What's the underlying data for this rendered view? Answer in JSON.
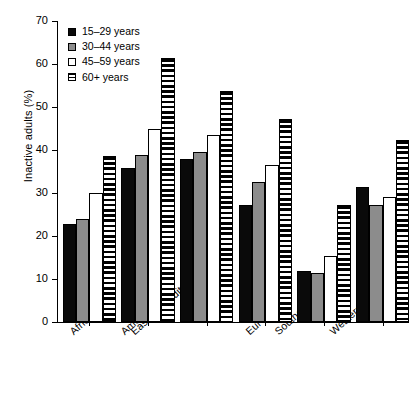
{
  "chart_data": {
    "type": "bar",
    "title": "",
    "xlabel": "",
    "ylabel": "Inactive adults (%)",
    "ylim": [
      0,
      70
    ],
    "yticks": [
      0,
      10,
      20,
      30,
      40,
      50,
      60,
      70
    ],
    "grid": false,
    "legend_position": "top-left",
    "categories": [
      "Africa",
      "Americas",
      "Eastern Mediterranean",
      "Europe",
      "Southeast Asia",
      "Western Pacific"
    ],
    "series": [
      {
        "name": "15–29 years",
        "color": "#0a0a0a",
        "pattern": "solid-black",
        "values": [
          22.8,
          35.9,
          37.8,
          27.3,
          11.9,
          31.3
        ]
      },
      {
        "name": "30–44 years",
        "color": "#8c8c8c",
        "pattern": "solid-gray",
        "values": [
          23.9,
          38.9,
          39.6,
          32.5,
          11.4,
          27.2
        ]
      },
      {
        "name": "45–59 years",
        "color": "#ffffff",
        "pattern": "solid-white",
        "values": [
          30.0,
          44.8,
          43.5,
          36.5,
          15.4,
          29.0
        ]
      },
      {
        "name": "60+ years",
        "color": "#000000",
        "pattern": "horizontal-stripes",
        "values": [
          38.7,
          61.5,
          53.7,
          47.3,
          27.2,
          42.3
        ]
      }
    ]
  },
  "legend": {
    "items": [
      {
        "label": "15–29 years"
      },
      {
        "label": "30–44 years"
      },
      {
        "label": "45–59 years"
      },
      {
        "label": "60+ years"
      }
    ]
  },
  "axes": {
    "y_title": "Inactive adults (%)",
    "y_tick_labels": [
      "0",
      "10",
      "20",
      "30",
      "40",
      "50",
      "60",
      "70"
    ],
    "x_tick_labels": [
      "Africa",
      "Americas",
      "Eastern Mediterranean",
      "Europe",
      "Southeast Asia",
      "Western Pacific"
    ]
  }
}
